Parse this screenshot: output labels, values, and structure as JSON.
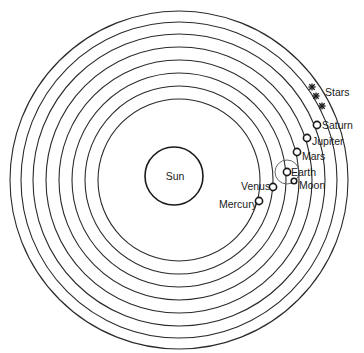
{
  "diagram": {
    "center": {
      "x": 179,
      "y": 180
    },
    "orbit_radii": [
      81,
      94,
      107,
      120,
      133,
      146,
      158,
      169
    ],
    "sun": {
      "label": "Sun",
      "x": 174,
      "y": 176,
      "r": 29
    },
    "bodies": [
      {
        "name": "Mercury",
        "label": "Mercury",
        "x": 259,
        "y": 201,
        "label_x": 219,
        "label_y": 208,
        "anchor": "start"
      },
      {
        "name": "Venus",
        "label": "Venus",
        "x": 273,
        "y": 187,
        "label_x": 241,
        "label_y": 190,
        "anchor": "start"
      },
      {
        "name": "Earth",
        "label": "Earth",
        "x": 287,
        "y": 172,
        "label_x": 291,
        "label_y": 176,
        "anchor": "start"
      },
      {
        "name": "Moon",
        "label": "Moon",
        "x": 294,
        "y": 181,
        "label_x": 299,
        "label_y": 189,
        "anchor": "start"
      },
      {
        "name": "Mars",
        "label": "Mars",
        "x": 297,
        "y": 152,
        "label_x": 302,
        "label_y": 160,
        "anchor": "start"
      },
      {
        "name": "Jupiter",
        "label": "Jupiter",
        "x": 307,
        "y": 138,
        "label_x": 312,
        "label_y": 145,
        "anchor": "start"
      },
      {
        "name": "Saturn",
        "label": "Saturn",
        "x": 317,
        "y": 125,
        "label_x": 322,
        "label_y": 129,
        "anchor": "start"
      }
    ],
    "moon_orbit": {
      "x": 287,
      "y": 172,
      "r": 12
    },
    "stars": {
      "label": "Stars",
      "label_x": 325,
      "label_y": 96,
      "points": [
        {
          "x": 312,
          "y": 87
        },
        {
          "x": 316,
          "y": 96
        },
        {
          "x": 322,
          "y": 106
        }
      ]
    }
  }
}
